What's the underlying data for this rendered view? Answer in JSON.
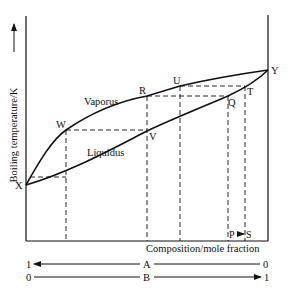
{
  "diagram": {
    "type": "phase-diagram",
    "title": "",
    "y_axis_label": "Boiling temperature/K",
    "x_axis_label": "Composition/mole fraction",
    "curves": {
      "vapour_label": "Vaporus",
      "liquid_label": "Liquidus"
    },
    "points": {
      "X": "X",
      "Y": "Y",
      "W": "W",
      "V": "V",
      "R": "R",
      "U": "U",
      "Q": "Q",
      "T": "T",
      "P": "P",
      "S": "S"
    },
    "arrow_PS": "P→S",
    "scale_A": {
      "label": "A",
      "left": "1",
      "right": "0",
      "direction": "left"
    },
    "scale_B": {
      "label": "B",
      "left": "0",
      "right": "1",
      "direction": "right"
    },
    "colors": {
      "line": "#111111",
      "background": "#ffffff"
    }
  }
}
